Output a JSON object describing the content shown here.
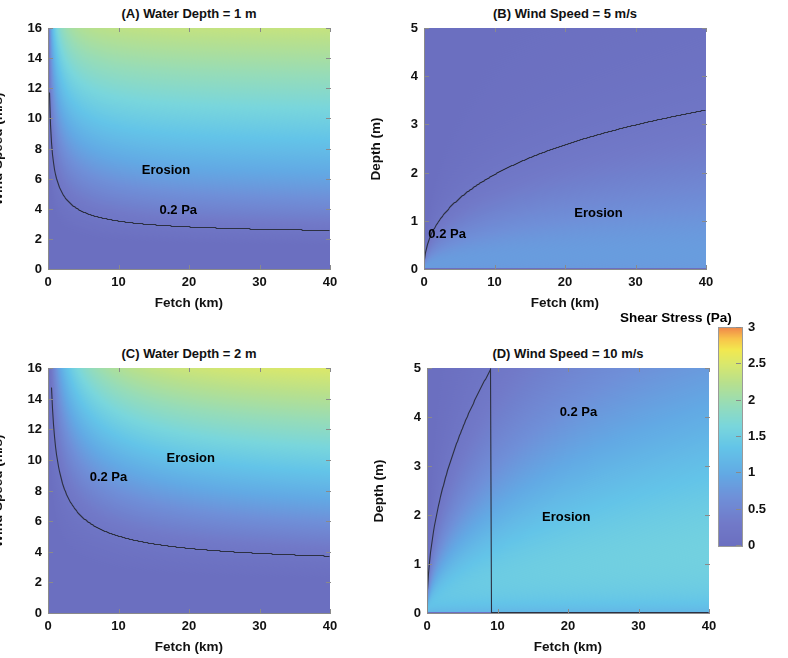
{
  "figure": {
    "background": "#ffffff",
    "width": 788,
    "height": 658
  },
  "colorbar": {
    "title": "Shear Stress (Pa)",
    "tick_labels": [
      "3",
      "2.5",
      "2",
      "1.5",
      "1",
      "0.5",
      "0"
    ],
    "tick_values": [
      3,
      2.5,
      2,
      1.5,
      1,
      0.5,
      0
    ],
    "range": [
      0,
      3
    ],
    "colormap": "jet-like",
    "stops": [
      {
        "v": 0.0,
        "color": "#6b6fc0"
      },
      {
        "v": 0.1,
        "color": "#7179c8"
      },
      {
        "v": 0.22,
        "color": "#6f8fd8"
      },
      {
        "v": 0.33,
        "color": "#62a9e4"
      },
      {
        "v": 0.45,
        "color": "#63c4e8"
      },
      {
        "v": 0.55,
        "color": "#79d6dc"
      },
      {
        "v": 0.65,
        "color": "#96dcb8"
      },
      {
        "v": 0.75,
        "color": "#b8e08c"
      },
      {
        "v": 0.84,
        "color": "#dbe86a"
      },
      {
        "v": 0.9,
        "color": "#f2e84f"
      },
      {
        "v": 0.95,
        "color": "#f8c44a"
      },
      {
        "v": 1.0,
        "color": "#f08a4a"
      }
    ]
  },
  "panels": [
    {
      "id": "A",
      "title": "(A) Water Depth = 1 m",
      "x_label": "Fetch (km)",
      "y_label": "Wind Speed (m/s)",
      "x_ticks": [
        0,
        10,
        20,
        30,
        40
      ],
      "x_tick_labels": [
        "0",
        "10",
        "20",
        "30",
        "40"
      ],
      "y_ticks": [
        0,
        2,
        4,
        6,
        8,
        10,
        12,
        14,
        16
      ],
      "y_tick_labels": [
        "0",
        "2",
        "4",
        "6",
        "8",
        "10",
        "12",
        "14",
        "16"
      ],
      "x_range": [
        0,
        40
      ],
      "y_range": [
        0,
        16
      ],
      "depth_m": 1,
      "mode": "depth-fixed",
      "annotations": [
        {
          "text": "Erosion",
          "x": 17.0,
          "y": 6.6
        },
        {
          "text": "0.2 Pa",
          "x": 19.5,
          "y": 3.9
        }
      ],
      "contour_label": "0.2 Pa"
    },
    {
      "id": "B",
      "title": "(B) Wind Speed = 5 m/s",
      "x_label": "Fetch (km)",
      "y_label": "Depth (m)",
      "x_ticks": [
        0,
        10,
        20,
        30,
        40
      ],
      "x_tick_labels": [
        "0",
        "10",
        "20",
        "30",
        "40"
      ],
      "y_ticks": [
        0,
        1,
        2,
        3,
        4,
        5
      ],
      "y_tick_labels": [
        "0",
        "1",
        "2",
        "3",
        "4",
        "5"
      ],
      "x_range": [
        0,
        40
      ],
      "y_range": [
        0,
        5
      ],
      "wind_ms": 5,
      "mode": "wind-fixed",
      "annotations": [
        {
          "text": "Erosion",
          "x": 25.0,
          "y": 1.17
        },
        {
          "text": "0.2 Pa",
          "x": 4.3,
          "y": 0.72
        }
      ],
      "contour_label": "0.2 Pa"
    },
    {
      "id": "C",
      "title": "(C) Water Depth = 2 m",
      "x_label": "Fetch (km)",
      "y_label": "Wind Speed (m/s)",
      "x_ticks": [
        0,
        10,
        20,
        30,
        40
      ],
      "x_tick_labels": [
        "0",
        "10",
        "20",
        "30",
        "40"
      ],
      "y_ticks": [
        0,
        2,
        4,
        6,
        8,
        10,
        12,
        14,
        16
      ],
      "y_tick_labels": [
        "0",
        "2",
        "4",
        "6",
        "8",
        "10",
        "12",
        "14",
        "16"
      ],
      "x_range": [
        0,
        40
      ],
      "y_range": [
        0,
        16
      ],
      "depth_m": 2,
      "mode": "depth-fixed",
      "annotations": [
        {
          "text": "Erosion",
          "x": 20.5,
          "y": 10.1
        },
        {
          "text": "0.2 Pa",
          "x": 9.6,
          "y": 8.9
        }
      ],
      "contour_label": "0.2 Pa"
    },
    {
      "id": "D",
      "title": "(D) Wind Speed = 10 m/s",
      "x_label": "Fetch (km)",
      "y_label": "Depth (m)",
      "x_ticks": [
        0,
        10,
        20,
        30,
        40
      ],
      "x_tick_labels": [
        "0",
        "10",
        "20",
        "30",
        "40"
      ],
      "y_ticks": [
        0,
        1,
        2,
        3,
        4,
        5
      ],
      "y_tick_labels": [
        "0",
        "1",
        "2",
        "3",
        "4",
        "5"
      ],
      "x_range": [
        0,
        40
      ],
      "y_range": [
        0,
        5
      ],
      "wind_ms": 10,
      "mode": "wind-fixed",
      "annotations": [
        {
          "text": "Erosion",
          "x": 20.0,
          "y": 1.95
        },
        {
          "text": "0.2 Pa",
          "x": 22.5,
          "y": 4.1
        }
      ],
      "contour_label": "0.2 Pa"
    }
  ],
  "chart_data": {
    "type": "heatmap",
    "zlabel": "Shear Stress (Pa)",
    "zlim": [
      0,
      3
    ],
    "grid": false,
    "legend": "colorbar-right",
    "contour_level_pa": 0.2,
    "panels": [
      {
        "id": "A",
        "title": "(A) Water Depth = 1 m",
        "xlabel": "Fetch (km)",
        "ylabel": "Wind Speed (m/s)",
        "xlim": [
          0,
          40
        ],
        "ylim": [
          0,
          16
        ],
        "fixed": {
          "depth_m": 1
        },
        "contour_0p2_pa": [
          {
            "x": 0.9,
            "y": 16.0
          },
          {
            "x": 1.3,
            "y": 13.0
          },
          {
            "x": 1.8,
            "y": 11.0
          },
          {
            "x": 2.6,
            "y": 9.4
          },
          {
            "x": 4.0,
            "y": 8.0
          },
          {
            "x": 5.5,
            "y": 7.1
          },
          {
            "x": 8.0,
            "y": 6.0
          },
          {
            "x": 11.0,
            "y": 5.0
          },
          {
            "x": 15.0,
            "y": 4.2
          },
          {
            "x": 20.0,
            "y": 3.5
          },
          {
            "x": 26.0,
            "y": 3.0
          },
          {
            "x": 32.0,
            "y": 2.6
          },
          {
            "x": 40.0,
            "y": 2.3
          }
        ],
        "low_stress_floor_y": 1.15,
        "peak_color_zone": "orange band from (13,16) to (40,7)"
      },
      {
        "id": "B",
        "title": "(B) Wind Speed = 5 m/s",
        "xlabel": "Fetch (km)",
        "ylabel": "Depth (m)",
        "xlim": [
          0,
          40
        ],
        "ylim": [
          0,
          5
        ],
        "fixed": {
          "wind_ms": 5
        },
        "contour_0p2_pa": [
          {
            "x": 0.2,
            "y": 0.15
          },
          {
            "x": 1.0,
            "y": 0.35
          },
          {
            "x": 2.5,
            "y": 0.55
          },
          {
            "x": 5.0,
            "y": 0.8
          },
          {
            "x": 10.0,
            "y": 1.2
          },
          {
            "x": 15.0,
            "y": 1.5
          },
          {
            "x": 20.0,
            "y": 1.8
          },
          {
            "x": 25.0,
            "y": 2.05
          },
          {
            "x": 30.0,
            "y": 2.25
          },
          {
            "x": 35.0,
            "y": 2.45
          },
          {
            "x": 40.0,
            "y": 2.6
          }
        ],
        "max_stress_visible_pa": 1.4
      },
      {
        "id": "C",
        "title": "(C) Water Depth = 2 m",
        "xlabel": "Fetch (km)",
        "ylabel": "Wind Speed (m/s)",
        "xlim": [
          0,
          40
        ],
        "ylim": [
          0,
          16
        ],
        "fixed": {
          "depth_m": 2
        },
        "contour_0p2_pa": [
          {
            "x": 2.7,
            "y": 16.0
          },
          {
            "x": 4.0,
            "y": 14.0
          },
          {
            "x": 5.5,
            "y": 12.5
          },
          {
            "x": 7.5,
            "y": 11.0
          },
          {
            "x": 10.0,
            "y": 9.6
          },
          {
            "x": 14.0,
            "y": 8.0
          },
          {
            "x": 19.0,
            "y": 6.7
          },
          {
            "x": 24.0,
            "y": 5.7
          },
          {
            "x": 30.0,
            "y": 4.9
          },
          {
            "x": 35.0,
            "y": 4.4
          },
          {
            "x": 40.0,
            "y": 4.0
          }
        ],
        "low_stress_floor_y": 1.1,
        "peak_color_zone": "orange upper-right corner near (35-40, 14-16)"
      },
      {
        "id": "D",
        "title": "(D) Wind Speed = 10 m/s",
        "xlabel": "Fetch (km)",
        "ylabel": "Depth (m)",
        "xlim": [
          0,
          40
        ],
        "ylim": [
          0,
          5
        ],
        "fixed": {
          "wind_ms": 10
        },
        "contour_0p2_pa": [
          {
            "x": 0.2,
            "y": 0.2
          },
          {
            "x": 1.0,
            "y": 0.75
          },
          {
            "x": 2.5,
            "y": 1.2
          },
          {
            "x": 5.0,
            "y": 1.75
          },
          {
            "x": 10.0,
            "y": 2.55
          },
          {
            "x": 15.0,
            "y": 3.1
          },
          {
            "x": 20.0,
            "y": 3.6
          },
          {
            "x": 25.0,
            "y": 4.1
          },
          {
            "x": 30.0,
            "y": 4.6
          },
          {
            "x": 33.0,
            "y": 5.0
          }
        ],
        "max_stress_visible_pa": 3.0,
        "peak_color_zone": "yellow-orange band from (8,0.6) to (40,1.3)"
      }
    ]
  }
}
